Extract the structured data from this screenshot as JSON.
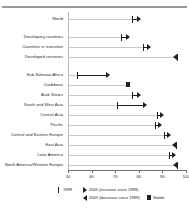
{
  "chart_data": {
    "type": "scatter",
    "title": "",
    "subtitle": "",
    "xlabel": "",
    "ylabel": "",
    "xlim": [
      50,
      100
    ],
    "grid": false,
    "legend_position": "bottom",
    "xticks": [
      "50",
      "60",
      "70",
      "80",
      "90",
      "100"
    ],
    "xtick_values": [
      50,
      60,
      70,
      80,
      90,
      100
    ],
    "categories": [
      "World",
      "Developing countries",
      "Countries in transition",
      "Developed countries",
      "Sub-Saharan Africa",
      "Caribbean",
      "Arab States",
      "South and West Asia",
      "Central Asia",
      "Pacific",
      "Central and Eastern Europe",
      "East Asia",
      "Latin America",
      "North America/Western Europe"
    ],
    "series": [
      {
        "name": "1999",
        "values": [
          77.5,
          72.5,
          82.0,
          96.5,
          54.0,
          75.5,
          77.5,
          71.0,
          88.0,
          87.0,
          91.0,
          96.0,
          93.0,
          96.5
        ]
      },
      {
        "name": "2005",
        "values": [
          81.0,
          76.5,
          85.5,
          94.5,
          68.0,
          75.5,
          81.0,
          83.5,
          91.0,
          90.0,
          94.0,
          94.0,
          96.0,
          94.5
        ]
      }
    ],
    "points": [
      {
        "category": "World",
        "value_1999": 77.5,
        "value_2005": 81.0,
        "direction": "increase"
      },
      {
        "category": "Developing countries",
        "value_1999": 72.5,
        "value_2005": 76.5,
        "direction": "increase"
      },
      {
        "category": "Countries in transition",
        "value_1999": 82.0,
        "value_2005": 85.5,
        "direction": "increase"
      },
      {
        "category": "Developed countries",
        "value_1999": 96.5,
        "value_2005": 94.5,
        "direction": "decrease"
      },
      {
        "category": "Sub-Saharan Africa",
        "value_1999": 54.0,
        "value_2005": 68.0,
        "direction": "increase"
      },
      {
        "category": "Caribbean",
        "value_1999": 75.5,
        "value_2005": 75.5,
        "direction": "stable"
      },
      {
        "category": "Arab States",
        "value_1999": 77.5,
        "value_2005": 81.0,
        "direction": "increase"
      },
      {
        "category": "South and West Asia",
        "value_1999": 71.0,
        "value_2005": 83.5,
        "direction": "increase"
      },
      {
        "category": "Central Asia",
        "value_1999": 88.0,
        "value_2005": 91.0,
        "direction": "increase"
      },
      {
        "category": "Pacific",
        "value_1999": 87.0,
        "value_2005": 90.0,
        "direction": "increase"
      },
      {
        "category": "Central and Eastern Europe",
        "value_1999": 91.0,
        "value_2005": 94.0,
        "direction": "increase"
      },
      {
        "category": "East Asia",
        "value_1999": 96.0,
        "value_2005": 94.0,
        "direction": "decrease"
      },
      {
        "category": "Latin America",
        "value_1999": 93.0,
        "value_2005": 96.0,
        "direction": "increase"
      },
      {
        "category": "North America/Western Europe",
        "value_1999": 96.5,
        "value_2005": 94.5,
        "direction": "decrease"
      }
    ],
    "legend": [
      {
        "symbol": "tick-marker",
        "label": "1999"
      },
      {
        "symbol": "arrow-right",
        "label": "2005 (increase since 1999)"
      },
      {
        "symbol": "arrow-left",
        "label": "2005 (decrease since 1999)"
      },
      {
        "symbol": "square",
        "label": "Stable"
      }
    ]
  }
}
